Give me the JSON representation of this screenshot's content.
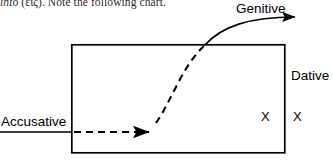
{
  "page": {
    "width": 333,
    "height": 160,
    "background": "#ffffff",
    "ink": "#000000"
  },
  "body_text": {
    "full": "into (εἰς). Note the following chart.",
    "italic_part": "into",
    "rest": " (εἰς). Note the following chart.",
    "clipped": true
  },
  "diagram": {
    "type": "schematic",
    "box": {
      "name": "main-rectangle",
      "x": 71,
      "y": 44,
      "width": 214,
      "height": 109,
      "stroke": "#000000",
      "stroke_width": 1.6,
      "fill": "none"
    },
    "accusative_arrow": {
      "label": "Accusative",
      "solid_segment": {
        "x1": 0,
        "y1": 132,
        "x2": 71,
        "y2": 132
      },
      "dashed_segment": {
        "x1": 71,
        "y1": 132,
        "x2": 150,
        "y2": 132
      },
      "dash_pattern": "7,5",
      "arrowhead_at": {
        "x": 152,
        "y": 132
      },
      "direction": "right"
    },
    "genitive_arrow": {
      "label": "Genitive",
      "dashed_curve": {
        "start": {
          "x": 156,
          "y": 122
        },
        "control1": {
          "x": 176,
          "y": 96
        },
        "control2": {
          "x": 186,
          "y": 62
        },
        "end": {
          "x": 206,
          "y": 44
        },
        "dash_pattern": "7,5"
      },
      "solid_curve": {
        "start": {
          "x": 206,
          "y": 44
        },
        "control1": {
          "x": 226,
          "y": 24
        },
        "control2": {
          "x": 252,
          "y": 17
        },
        "end": {
          "x": 297,
          "y": 17
        }
      },
      "arrowhead_at": {
        "x": 302,
        "y": 17
      },
      "direction": "right",
      "crosses_box_top_at": {
        "x": 206,
        "y": 44
      }
    },
    "dative_label": "Dative",
    "x_marks": [
      {
        "name": "x-inside-box",
        "text": "X",
        "x": 265,
        "y": 116,
        "location": "inside"
      },
      {
        "name": "x-outside-box",
        "text": "X",
        "x": 297,
        "y": 116,
        "location": "outside"
      }
    ]
  },
  "labels": {
    "accusative": "Accusative",
    "genitive": "Genitive",
    "dative": "Dative",
    "x": "X"
  }
}
